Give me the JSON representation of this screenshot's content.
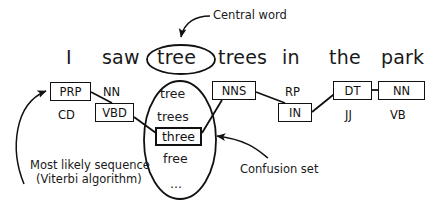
{
  "diagram": {
    "sentence": {
      "words": [
        {
          "text": "I",
          "x": 66,
          "y": 46
        },
        {
          "text": "saw",
          "x": 102,
          "y": 46
        },
        {
          "text": "tree",
          "x": 157,
          "y": 46,
          "circled": true
        },
        {
          "text": "trees",
          "x": 218,
          "y": 46
        },
        {
          "text": "in",
          "x": 282,
          "y": 46
        },
        {
          "text": "the",
          "x": 329,
          "y": 46
        },
        {
          "text": "park",
          "x": 381,
          "y": 46
        }
      ]
    },
    "tag_boxes": [
      {
        "label": "PRP",
        "x": 50,
        "y": 82,
        "w": 41,
        "h": 19,
        "thick": false
      },
      {
        "label": "VBD",
        "x": 95,
        "y": 103,
        "w": 39,
        "h": 19,
        "thick": false
      },
      {
        "label": "NNS",
        "x": 212,
        "y": 81,
        "w": 44,
        "h": 19,
        "thick": false
      },
      {
        "label": "IN",
        "x": 278,
        "y": 103,
        "w": 34,
        "h": 19,
        "thick": false
      },
      {
        "label": "DT",
        "x": 333,
        "y": 81,
        "w": 39,
        "h": 19,
        "thick": false
      },
      {
        "label": "NN",
        "x": 378,
        "y": 81,
        "w": 47,
        "h": 19,
        "thick": false
      }
    ],
    "alt_tags": [
      {
        "label": "NN",
        "x": 103,
        "y": 85
      },
      {
        "label": "CD",
        "x": 58,
        "y": 108
      },
      {
        "label": "RP",
        "x": 285,
        "y": 85
      },
      {
        "label": "JJ",
        "x": 345,
        "y": 108
      },
      {
        "label": "VB",
        "x": 390,
        "y": 108
      }
    ],
    "confusion_set": {
      "items": [
        {
          "text": "tree",
          "x": 160,
          "y": 86,
          "boxed": false
        },
        {
          "text": "trees",
          "x": 157,
          "y": 109,
          "boxed": false
        },
        {
          "text": "three",
          "x": 155,
          "y": 127,
          "boxed": true,
          "w": 47,
          "h": 19
        },
        {
          "text": "free",
          "x": 163,
          "y": 151,
          "boxed": false
        },
        {
          "text": "...",
          "x": 170,
          "y": 176,
          "boxed": false
        }
      ]
    },
    "annotations": [
      {
        "id": "central-word",
        "text": "Central word",
        "x": 213,
        "y": 8
      },
      {
        "id": "confusion-set",
        "text": "Confusion set",
        "x": 240,
        "y": 162
      },
      {
        "id": "viterbi-line-1",
        "text": "Most likely sequence",
        "x": 30,
        "y": 158
      },
      {
        "id": "viterbi-line-2",
        "text": "(Viterbi algorithm)",
        "x": 30,
        "y": 172
      }
    ],
    "colors": {
      "ink": "#111111",
      "text": "#1a1a1a",
      "background": "#ffffff"
    }
  }
}
